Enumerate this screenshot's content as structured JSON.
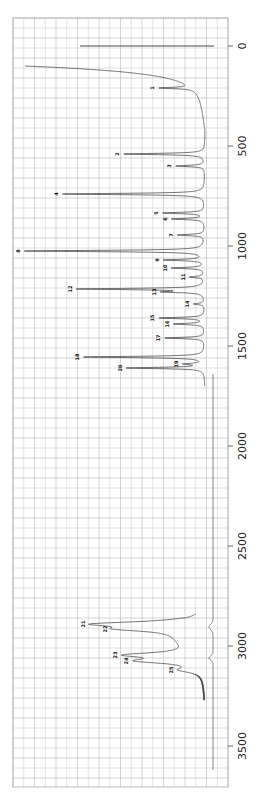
{
  "chart_data": {
    "type": "line",
    "title": "",
    "orientation": "rotated-90 (wavenumber increases downward, intensity increases leftward)",
    "xlabel": "Raman shift (cm-1)",
    "ylabel": "Intensity",
    "xlim": [
      -140,
      3700
    ],
    "x_ticks": [
      0,
      500,
      1000,
      1500,
      2000,
      2500,
      3000,
      3500
    ],
    "x_tick_labels": [
      "0",
      "500",
      "1000",
      "1500",
      "2000",
      "2500",
      "3000",
      "3500"
    ],
    "grid": true,
    "legend": null,
    "series": [
      {
        "name": "spectrum",
        "peaks": [
          {
            "label": "1",
            "x": 210,
            "rel_intensity": 0.18
          },
          {
            "label": "2",
            "x": 540,
            "rel_intensity": 0.45
          },
          {
            "label": "3",
            "x": 600,
            "rel_intensity": 0.16
          },
          {
            "label": "4",
            "x": 740,
            "rel_intensity": 0.79
          },
          {
            "label": "5",
            "x": 835,
            "rel_intensity": 0.23
          },
          {
            "label": "6",
            "x": 865,
            "rel_intensity": 0.18
          },
          {
            "label": "7",
            "x": 945,
            "rel_intensity": 0.15
          },
          {
            "label": "8",
            "x": 1025,
            "rel_intensity": 1.0
          },
          {
            "label": "9",
            "x": 1070,
            "rel_intensity": 0.22
          },
          {
            "label": "10",
            "x": 1110,
            "rel_intensity": 0.18
          },
          {
            "label": "11",
            "x": 1155,
            "rel_intensity": 0.08
          },
          {
            "label": "12",
            "x": 1215,
            "rel_intensity": 0.7
          },
          {
            "label": "13",
            "x": 1230,
            "rel_intensity": 0.2
          },
          {
            "label": "14",
            "x": 1290,
            "rel_intensity": 0.06
          },
          {
            "label": "15",
            "x": 1360,
            "rel_intensity": 0.25
          },
          {
            "label": "16",
            "x": 1390,
            "rel_intensity": 0.17
          },
          {
            "label": "17",
            "x": 1460,
            "rel_intensity": 0.22
          },
          {
            "label": "18",
            "x": 1555,
            "rel_intensity": 0.67
          },
          {
            "label": "19",
            "x": 1590,
            "rel_intensity": 0.1
          },
          {
            "label": "20",
            "x": 1610,
            "rel_intensity": 0.43
          },
          {
            "label": "21",
            "x": 2890,
            "rel_intensity": 0.52
          },
          {
            "label": "22",
            "x": 2915,
            "rel_intensity": 0.31
          },
          {
            "label": "23",
            "x": 3045,
            "rel_intensity": 0.37
          },
          {
            "label": "24",
            "x": 3075,
            "rel_intensity": 0.31
          },
          {
            "label": "25",
            "x": 3120,
            "rel_intensity": 0.11
          }
        ],
        "features": {
          "rayleigh_line_x": 0,
          "rayleigh_line_rel_intensity": 0.73,
          "broad_low_freq_wing_start": 100,
          "spectrum_end_x": 3270
        }
      },
      {
        "name": "baseline",
        "description": "near-flat reference trace running from ~1650 to ~3600 cm-1 with small dips near 2900 and 3060"
      }
    ]
  }
}
